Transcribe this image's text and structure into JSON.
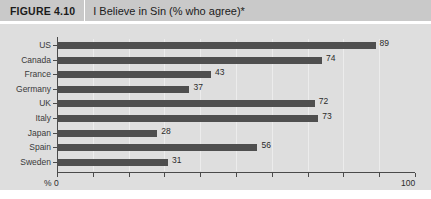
{
  "header": {
    "figure_number": "FIGURE 4.10",
    "title": "I Believe in Sin (% who agree)*"
  },
  "axis": {
    "percent_symbol": "%",
    "min_label": "0",
    "max_label": "100"
  },
  "chart_data": {
    "type": "bar",
    "orientation": "horizontal",
    "title": "I Believe in Sin (% who agree)*",
    "xlabel": "%",
    "ylabel": "",
    "xlim": [
      0,
      100
    ],
    "tick_interval": 10,
    "grid": true,
    "legend": "none",
    "categories": [
      "US",
      "Canada",
      "France",
      "Germany",
      "UK",
      "Italy",
      "Japan",
      "Spain",
      "Sweden"
    ],
    "values": [
      89,
      74,
      43,
      37,
      72,
      73,
      28,
      56,
      31
    ],
    "bar_color": "#4f4f4f",
    "panel_color": "#dedede",
    "header_color": "#c9c9c9"
  }
}
